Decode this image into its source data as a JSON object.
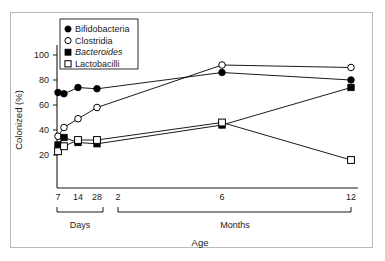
{
  "chart_data": {
    "type": "line",
    "title": "",
    "xlabel": "Age",
    "ylabel": "Colonized (%)",
    "ylim": [
      10,
      108
    ],
    "yticks": [
      20,
      40,
      60,
      80,
      100
    ],
    "ytick_labels": [
      "20",
      "40",
      "60",
      "80",
      "100"
    ],
    "grid": false,
    "legend_position": "top-left",
    "x_axis_groups": [
      {
        "label": "Days",
        "ticks": [
          "7",
          "14",
          "28"
        ]
      },
      {
        "label": "Months",
        "ticks": [
          "2",
          "6",
          "12"
        ]
      }
    ],
    "x_tick_labels": [
      "7",
      "14",
      "28",
      "2",
      "6",
      "12"
    ],
    "series": [
      {
        "name": "Bifidobacteria",
        "marker": "filled-circle",
        "color": "#000000",
        "points": [
          {
            "x_label": "7 days",
            "x": 7,
            "y": 70
          },
          {
            "x_label": "8 days",
            "x": 8.5,
            "y": 69
          },
          {
            "x_label": "14 days",
            "x": 14,
            "y": 74
          },
          {
            "x_label": "28 days",
            "x": 28,
            "y": 73
          },
          {
            "x_label": "5 months",
            "x": 150,
            "y": 86
          },
          {
            "x_label": "12 months",
            "x": 365,
            "y": 80
          }
        ]
      },
      {
        "name": "Clostridia",
        "marker": "open-circle",
        "color": "#000000",
        "points": [
          {
            "x_label": "7 days",
            "x": 7,
            "y": 35
          },
          {
            "x_label": "8 days",
            "x": 8.5,
            "y": 42
          },
          {
            "x_label": "14 days",
            "x": 14,
            "y": 49
          },
          {
            "x_label": "28 days",
            "x": 28,
            "y": 58
          },
          {
            "x_label": "5 months",
            "x": 150,
            "y": 92
          },
          {
            "x_label": "12 months",
            "x": 365,
            "y": 90
          }
        ]
      },
      {
        "name": "Bacteroides",
        "marker": "filled-square",
        "color": "#000000",
        "italic": true,
        "points": [
          {
            "x_label": "7 days",
            "x": 7,
            "y": 28
          },
          {
            "x_label": "8 days",
            "x": 8.5,
            "y": 34
          },
          {
            "x_label": "14 days",
            "x": 14,
            "y": 30
          },
          {
            "x_label": "28 days",
            "x": 28,
            "y": 29
          },
          {
            "x_label": "5 months",
            "x": 150,
            "y": 44
          },
          {
            "x_label": "12 months",
            "x": 365,
            "y": 74
          }
        ]
      },
      {
        "name": "Lactobacilli",
        "marker": "open-square",
        "color": "#000000",
        "points": [
          {
            "x_label": "7 days",
            "x": 7,
            "y": 23
          },
          {
            "x_label": "8 days",
            "x": 8.5,
            "y": 27
          },
          {
            "x_label": "14 days",
            "x": 14,
            "y": 32
          },
          {
            "x_label": "28 days",
            "x": 28,
            "y": 32
          },
          {
            "x_label": "5 months",
            "x": 150,
            "y": 46
          },
          {
            "x_label": "12 months",
            "x": 365,
            "y": 16
          }
        ]
      }
    ]
  },
  "legend": {
    "items": [
      {
        "label": "Bifidobacteria",
        "marker": "filled-circle"
      },
      {
        "label": "Clostridia",
        "marker": "open-circle"
      },
      {
        "label": "Bacteroides",
        "marker": "filled-square"
      },
      {
        "label": "Lactobacilli",
        "marker": "open-square"
      }
    ]
  },
  "axes": {
    "y_label": "Colonized (%)",
    "x_label": "Age",
    "y_ticks": [
      "100",
      "80",
      "60",
      "40",
      "20"
    ],
    "x_ticks_days": [
      "7",
      "14",
      "28"
    ],
    "x_ticks_months": [
      "2",
      "6",
      "12"
    ],
    "group_days": "Days",
    "group_months": "Months"
  },
  "colors": {
    "line": "#1a1a1a",
    "axis": "#1a1a1a",
    "frame": "#b9b9b9",
    "background": "#ffffff"
  }
}
